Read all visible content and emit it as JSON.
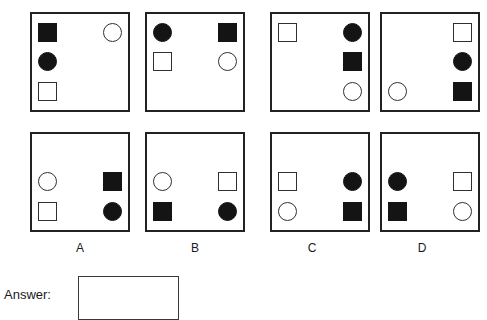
{
  "puzzle": {
    "type": "abstract-reasoning-matrix",
    "shape_legend": {
      "sq-filled": "filled-square",
      "sq-open": "open-square",
      "ci-filled": "filled-circle",
      "ci-open": "open-circle",
      "empty": "empty-cell"
    },
    "grid_rows": 3,
    "grid_cols": 2,
    "colors": {
      "fill": "#141414",
      "outline": "#303030",
      "panel_border": "#222222",
      "background": "#ffffff",
      "text": "#1a1a1a"
    },
    "question_panels": [
      {
        "name": "question-panel-1",
        "cells": [
          "sq-filled",
          "ci-open",
          "ci-filled",
          "empty",
          "sq-open",
          "empty"
        ]
      },
      {
        "name": "question-panel-2",
        "cells": [
          "ci-filled",
          "sq-filled",
          "sq-open",
          "ci-open",
          "empty",
          "empty"
        ]
      },
      {
        "name": "question-panel-3",
        "cells": [
          "sq-open",
          "ci-filled",
          "empty",
          "sq-filled",
          "empty",
          "ci-open"
        ]
      },
      {
        "name": "question-panel-4",
        "cells": [
          "empty",
          "sq-open",
          "empty",
          "ci-filled",
          "ci-open",
          "sq-filled"
        ]
      }
    ],
    "option_panels": [
      {
        "name": "option-panel-a",
        "label": "A",
        "cells": [
          "empty",
          "empty",
          "ci-open",
          "sq-filled",
          "sq-open",
          "ci-filled"
        ]
      },
      {
        "name": "option-panel-b",
        "label": "B",
        "cells": [
          "empty",
          "empty",
          "ci-open",
          "sq-open",
          "sq-filled",
          "ci-filled"
        ]
      },
      {
        "name": "option-panel-c",
        "label": "C",
        "cells": [
          "empty",
          "empty",
          "sq-open",
          "ci-filled",
          "ci-open",
          "sq-filled"
        ]
      },
      {
        "name": "option-panel-d",
        "label": "D",
        "cells": [
          "empty",
          "empty",
          "ci-filled",
          "sq-open",
          "sq-filled",
          "ci-open"
        ]
      }
    ]
  },
  "answer": {
    "caption": "Answer:",
    "value": "",
    "placeholder": ""
  }
}
